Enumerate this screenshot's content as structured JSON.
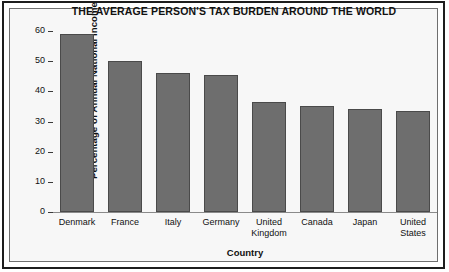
{
  "chart_data": {
    "type": "bar",
    "title": "THE AVERAGE PERSON'S TAX BURDEN AROUND THE WORLD",
    "xlabel": "Country",
    "ylabel": "Percentage of Annual National Income",
    "categories": [
      "Denmark",
      "France",
      "Italy",
      "Germany",
      "United Kingdom",
      "Canada",
      "Japan",
      "United States"
    ],
    "values": [
      59,
      50,
      46,
      45.5,
      36.5,
      35,
      34,
      33.5
    ],
    "ylim": [
      0,
      60
    ],
    "yticks": [
      0,
      10,
      20,
      30,
      40,
      50,
      60
    ],
    "ytick_labels": [
      "0",
      "10",
      "20",
      "30",
      "40",
      "50",
      "60"
    ],
    "grid": false,
    "legend": null,
    "bar_color": "#6e6e6e",
    "bar_edge_color": "#4a4a4a",
    "plot_background": "#f7f7f7"
  }
}
